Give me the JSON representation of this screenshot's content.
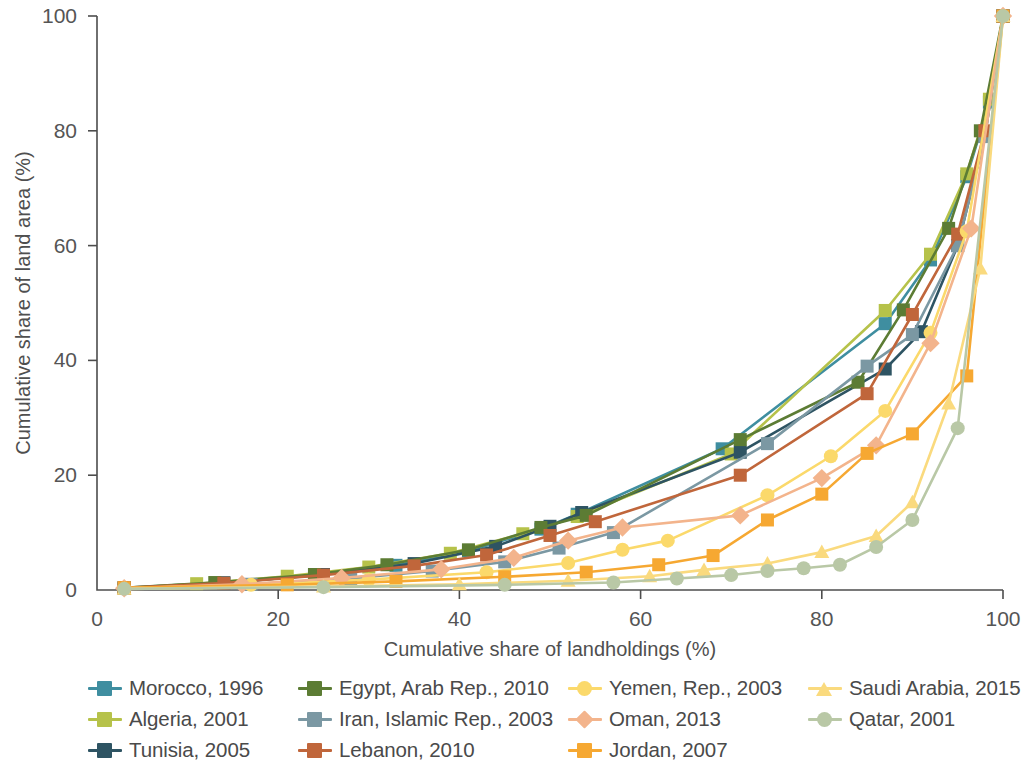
{
  "chart_data": {
    "type": "line",
    "title": "",
    "xlabel": "Cumulative share of landholdings (%)",
    "ylabel": "Cumulative share of land area (%)",
    "xlim": [
      0,
      100
    ],
    "ylim": [
      0,
      100
    ],
    "xticks": [
      0,
      20,
      40,
      60,
      80,
      100
    ],
    "yticks": [
      0,
      20,
      40,
      60,
      80,
      100
    ],
    "grid": false,
    "legend_position": "bottom",
    "series": [
      {
        "name": "Morocco, 1996",
        "color": "#3f8ea0",
        "marker": "square",
        "x": [
          3,
          14,
          24.5,
          33,
          41,
          49,
          53,
          69,
          87,
          92,
          96,
          98.5,
          100
        ],
        "y": [
          0.4,
          1.3,
          2.6,
          4.3,
          6.8,
          10.6,
          13.2,
          24.6,
          46.4,
          57.5,
          72.0,
          85.0,
          100
        ]
      },
      {
        "name": "Algeria, 2001",
        "color": "#b6c24a",
        "marker": "square",
        "x": [
          3,
          11,
          21,
          30,
          39,
          47,
          53,
          70,
          87,
          92,
          96,
          98.5,
          100
        ],
        "y": [
          0.3,
          1.1,
          2.4,
          4.0,
          6.4,
          9.8,
          12.8,
          23.7,
          48.7,
          58.5,
          72.5,
          85.5,
          100
        ]
      },
      {
        "name": "Tunisia, 2005",
        "color": "#2e5463",
        "marker": "square",
        "x": [
          3,
          14,
          25,
          35,
          44,
          50,
          53.5,
          71,
          87,
          91,
          95,
          98,
          100
        ],
        "y": [
          0.3,
          1.2,
          2.7,
          4.6,
          7.6,
          11.1,
          13.5,
          24.0,
          38.5,
          45.0,
          60.0,
          79.0,
          100
        ]
      },
      {
        "name": "Egypt, Arab Rep., 2010",
        "color": "#5c7c34",
        "marker": "square",
        "x": [
          3,
          13,
          24,
          32,
          41,
          49,
          54,
          71,
          84,
          89,
          94,
          97.5,
          100
        ],
        "y": [
          0.4,
          1.3,
          2.7,
          4.4,
          7.0,
          10.9,
          13.0,
          26.2,
          36.2,
          48.8,
          63.0,
          80.0,
          100
        ]
      },
      {
        "name": "Iran, Islamic Rep., 2003",
        "color": "#7b98a3",
        "marker": "square",
        "x": [
          3,
          17,
          28,
          37,
          45,
          51,
          57,
          74,
          85,
          90,
          95,
          98,
          100
        ],
        "y": [
          0.3,
          1.0,
          2.0,
          3.3,
          4.9,
          7.3,
          10.0,
          25.5,
          39.0,
          44.5,
          60.0,
          79.0,
          100
        ]
      },
      {
        "name": "Lebanon, 2010",
        "color": "#c0663b",
        "marker": "square",
        "x": [
          3,
          14,
          25,
          35,
          43,
          50,
          55,
          71,
          85,
          90,
          95,
          98,
          100
        ],
        "y": [
          0.4,
          1.2,
          2.6,
          4.2,
          6.1,
          9.5,
          11.9,
          20.0,
          34.2,
          48.0,
          62.0,
          80.0,
          100
        ]
      },
      {
        "name": "Yemen, Rep., 2003",
        "color": "#fbd96b",
        "marker": "circle",
        "x": [
          3,
          17,
          30,
          43,
          52,
          58,
          63,
          74,
          81,
          87,
          92,
          96,
          100
        ],
        "y": [
          0.3,
          0.9,
          1.8,
          3.1,
          4.7,
          7.0,
          8.6,
          16.5,
          23.3,
          31.2,
          44.8,
          62.5,
          100
        ]
      },
      {
        "name": "Oman, 2013",
        "color": "#f3b48c",
        "marker": "diamond",
        "x": [
          3,
          16,
          27,
          38,
          46,
          52,
          58,
          71,
          80,
          86,
          92,
          96.5,
          100
        ],
        "y": [
          0.3,
          1.0,
          2.1,
          3.6,
          5.6,
          8.6,
          10.9,
          13.0,
          19.5,
          25.2,
          43.0,
          63.0,
          100
        ]
      },
      {
        "name": "Jordan, 2007",
        "color": "#f6a832",
        "marker": "square",
        "x": [
          3,
          21,
          33,
          45,
          54,
          62,
          68,
          74,
          80,
          85,
          90,
          96,
          100
        ],
        "y": [
          0.4,
          0.9,
          1.5,
          2.3,
          3.1,
          4.4,
          6.0,
          12.2,
          16.7,
          23.8,
          27.2,
          37.3,
          100
        ]
      },
      {
        "name": "Saudi Arabia, 2015",
        "color": "#fada7e",
        "marker": "triangle",
        "x": [
          3,
          25,
          40,
          52,
          61,
          67,
          74,
          80,
          86,
          90,
          94,
          97.5,
          100
        ],
        "y": [
          0.2,
          0.6,
          1.0,
          1.6,
          2.4,
          3.5,
          4.6,
          6.6,
          9.4,
          15.3,
          32.5,
          56.0,
          100
        ]
      },
      {
        "name": "Qatar, 2001",
        "color": "#b9c8a6",
        "marker": "circle",
        "x": [
          3,
          25,
          45,
          57,
          64,
          70,
          74,
          78,
          82,
          86,
          90,
          95,
          100
        ],
        "y": [
          0.2,
          0.5,
          0.9,
          1.3,
          2.0,
          2.6,
          3.3,
          3.8,
          4.4,
          7.5,
          12.2,
          28.2,
          100
        ]
      }
    ]
  },
  "axes": {
    "x_title": "Cumulative share of landholdings (%)",
    "y_title": "Cumulative share of land area (%)",
    "x_tick_labels": [
      "0",
      "20",
      "40",
      "60",
      "80",
      "100"
    ],
    "y_tick_labels": [
      "0",
      "20",
      "40",
      "60",
      "80",
      "100"
    ]
  },
  "legend": {
    "items": [
      {
        "label": "Morocco, 1996",
        "color": "#3f8ea0",
        "marker": "square"
      },
      {
        "label": "Algeria, 2001",
        "color": "#b6c24a",
        "marker": "square"
      },
      {
        "label": "Tunisia, 2005",
        "color": "#2e5463",
        "marker": "square"
      },
      {
        "label": "Egypt, Arab Rep., 2010",
        "color": "#5c7c34",
        "marker": "square"
      },
      {
        "label": "Iran, Islamic Rep., 2003",
        "color": "#7b98a3",
        "marker": "square"
      },
      {
        "label": "Lebanon, 2010",
        "color": "#c0663b",
        "marker": "square"
      },
      {
        "label": "Yemen, Rep., 2003",
        "color": "#fbd96b",
        "marker": "circle"
      },
      {
        "label": "Oman, 2013",
        "color": "#f3b48c",
        "marker": "diamond"
      },
      {
        "label": "Jordan, 2007",
        "color": "#f6a832",
        "marker": "square"
      },
      {
        "label": "Saudi Arabia, 2015",
        "color": "#fada7e",
        "marker": "triangle"
      },
      {
        "label": "Qatar, 2001",
        "color": "#b9c8a6",
        "marker": "circle"
      }
    ]
  }
}
